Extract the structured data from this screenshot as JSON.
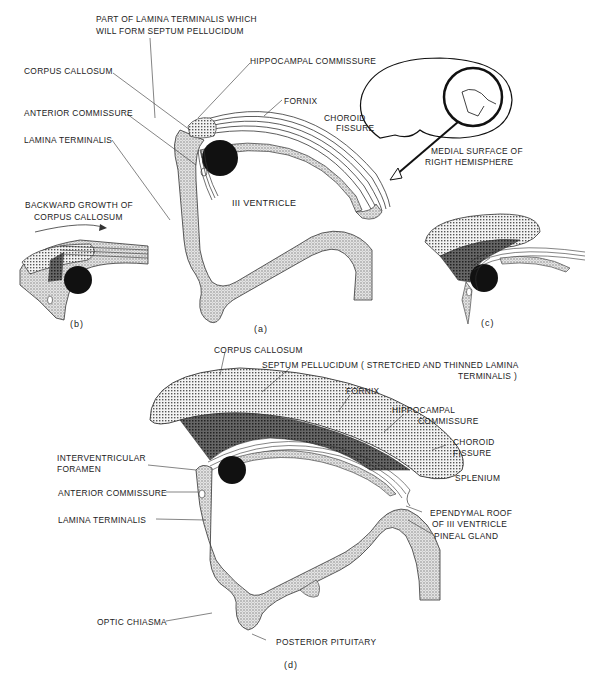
{
  "figure": {
    "panel_a": {
      "caption": "(a)",
      "labels": {
        "lamina_septum_line1": "PART OF LAMINA TERMINALIS WHICH",
        "lamina_septum_line2": "WILL FORM SEPTUM PELLUCIDUM",
        "corpus_callosum": "CORPUS CALLOSUM",
        "hippocampal_commissure": "HIPPOCAMPAL COMMISSURE",
        "fornix": "FORNIX",
        "choroid_line1": "CHOROID",
        "choroid_line2": "FISSURE",
        "anterior_commissure": "ANTERIOR COMMISSURE",
        "lamina_terminalis": "LAMINA TERMINALIS",
        "third_ventricle": "III VENTRICLE"
      }
    },
    "inset": {
      "label_line1": "MEDIAL SURFACE OF",
      "label_line2": "RIGHT HEMISPHERE"
    },
    "panel_b": {
      "caption": "(b)",
      "label_line1": "BACKWARD GROWTH OF",
      "label_line2": "CORPUS CALLOSUM"
    },
    "panel_c": {
      "caption": "(c)"
    },
    "panel_d": {
      "caption": "(d)",
      "labels": {
        "corpus_callosum": "CORPUS CALLOSUM",
        "septum_line1": "SEPTUM PELLUCIDUM ( STRETCHED AND THINNED LAMINA",
        "septum_line2": "TERMINALIS )",
        "fornix": "FORNIX",
        "hippocampal_line1": "HIPPOCAMPAL",
        "hippocampal_line2": "COMMISSURE",
        "choroid_line1": "CHOROID",
        "choroid_line2": "FISSURE",
        "splenium": "SPLENIUM",
        "interventricular_line1": "INTERVENTRICULAR",
        "interventricular_line2": "FORAMEN",
        "anterior_commissure": "ANTERIOR COMMISSURE",
        "lamina_terminalis": "LAMINA TERMINALIS",
        "ependymal_line1": "EPENDYMAL ROOF",
        "ependymal_line2": "OF III VENTRICLE",
        "pineal_gland": "PINEAL GLAND",
        "optic_chiasma": "OPTIC CHIASMA",
        "posterior_pituitary": "POSTERIOR PITUITARY"
      }
    }
  }
}
